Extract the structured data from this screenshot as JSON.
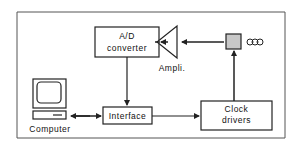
{
  "diagram": {
    "blocks": {
      "ad_converter": {
        "line1": "A/D",
        "line2": "converter"
      },
      "interface": {
        "label": "Interface"
      },
      "clock_drivers": {
        "line1": "Clock",
        "line2": "drivers"
      }
    },
    "labels": {
      "amplifier": "Ampli.",
      "computer": "Computer",
      "ccd": "CCD"
    },
    "colors": {
      "line": "#222222",
      "ccd_fill": "#c8c8c8",
      "background": "#ffffff"
    }
  }
}
